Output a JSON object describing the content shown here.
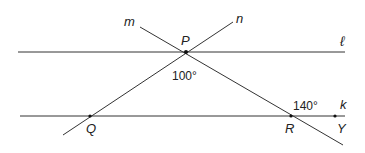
{
  "diagram": {
    "lines": {
      "l": {
        "label": "ℓ",
        "x1": 18,
        "y1": 52,
        "x2": 345,
        "y2": 52
      },
      "k": {
        "label": "k",
        "x1": 20,
        "y1": 116,
        "x2": 345,
        "y2": 116
      },
      "m": {
        "label": "m",
        "x1": 140,
        "y1": 27,
        "x2": 343,
        "y2": 145
      },
      "n": {
        "label": "n",
        "x1": 233,
        "y1": 22,
        "x2": 63,
        "y2": 135
      }
    },
    "points": {
      "P": {
        "label": "P",
        "x": 186,
        "y": 52
      },
      "Q": {
        "label": "Q",
        "x": 90,
        "y": 116
      },
      "R": {
        "label": "R",
        "x": 291,
        "y": 116
      },
      "Y": {
        "label": "Y",
        "x": 335,
        "y": 116
      }
    },
    "angles": {
      "at_P": "100°",
      "at_R": "140°"
    },
    "colors": {
      "line": "#333333",
      "text": "#222222"
    }
  }
}
